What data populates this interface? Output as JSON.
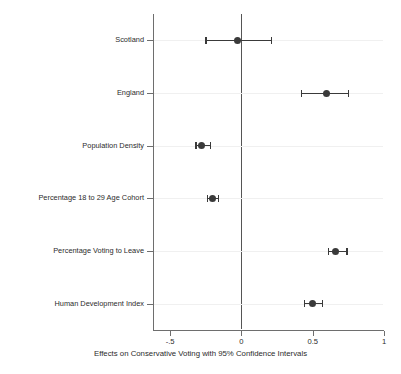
{
  "chart_data": {
    "type": "scatter",
    "title": "",
    "xlabel": "Effects on Conservative Voting with 95% Confidence Intervals",
    "ylabel": "",
    "xlim": [
      -0.62,
      1.0
    ],
    "xticks": [
      -0.5,
      0,
      0.5,
      1
    ],
    "xticklabels": [
      "-.5",
      "0",
      "0.5",
      "1"
    ],
    "grid": true,
    "grid_axis": "y",
    "legend": "none",
    "reference_line": 0,
    "orientation": "horizontal",
    "marker_color": "#3a3a3a",
    "categories": [
      "Scotland",
      "England",
      "Population Density",
      "Percentage 18 to 29 Age Cohort",
      "Percentage Voting to Leave",
      "Human Development Index"
    ],
    "points": [
      {
        "label": "Scotland",
        "estimate": -0.025,
        "ci_low": -0.25,
        "ci_high": 0.21
      },
      {
        "label": "England",
        "estimate": 0.6,
        "ci_low": 0.42,
        "ci_high": 0.75
      },
      {
        "label": "Population Density",
        "estimate": -0.28,
        "ci_low": -0.32,
        "ci_high": -0.22
      },
      {
        "label": "Percentage 18 to 29 Age Cohort",
        "estimate": -0.2,
        "ci_low": -0.24,
        "ci_high": -0.16
      },
      {
        "label": "Percentage Voting to Leave",
        "estimate": 0.66,
        "ci_low": 0.61,
        "ci_high": 0.74
      },
      {
        "label": "Human Development Index",
        "estimate": 0.5,
        "ci_low": 0.44,
        "ci_high": 0.57
      }
    ]
  },
  "axis": {
    "x_title": "Effects on Conservative Voting with 95% Confidence Intervals",
    "tick_labels": [
      "-.5",
      "0",
      "0.5",
      "1"
    ]
  },
  "category_labels": [
    "Scotland",
    "England",
    "Population Density",
    "Percentage 18 to 29 Age Cohort",
    "Percentage Voting to Leave",
    "Human Development Index"
  ],
  "title": ""
}
